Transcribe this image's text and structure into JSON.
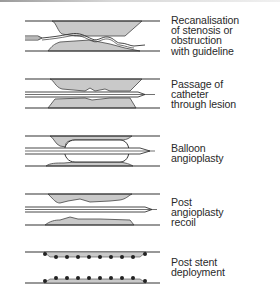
{
  "figure": {
    "stages": [
      {
        "id": "recanalisation",
        "label": "Recanalisation\nof stenosis or\nobstruction\nwith guideline"
      },
      {
        "id": "catheter-passage",
        "label": "Passage of\ncatheter\nthrough lesion"
      },
      {
        "id": "balloon",
        "label": "Balloon\nangioplasty"
      },
      {
        "id": "recoil",
        "label": "Post\nangioplasty\nrecoil"
      },
      {
        "id": "stent",
        "label": "Post stent\ndeployment"
      }
    ],
    "colors": {
      "wall": "#333333",
      "plaque": "#c9c9c9",
      "text": "#2a2a2a"
    }
  }
}
